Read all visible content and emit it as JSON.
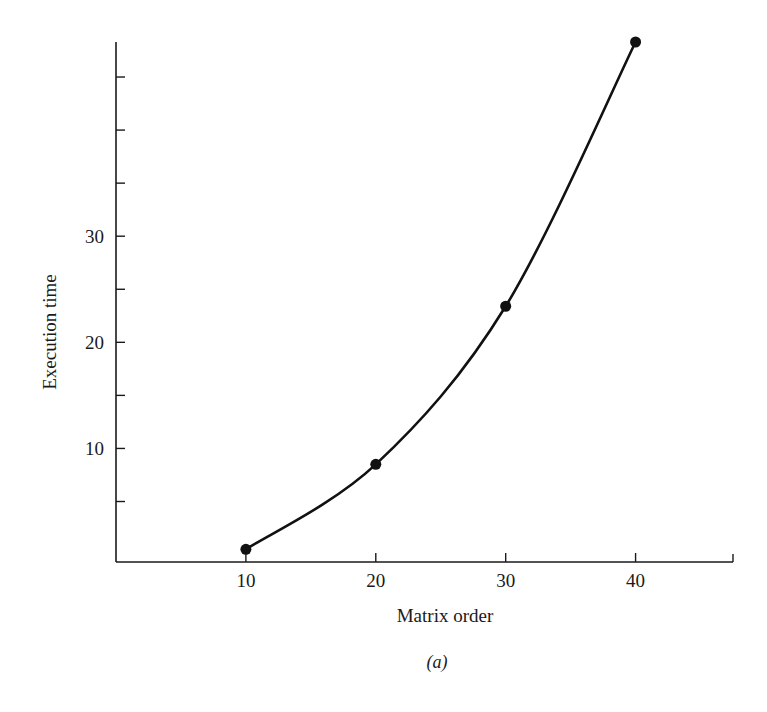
{
  "chart_data": {
    "type": "line",
    "title": "",
    "caption": "(a)",
    "xlabel": "Matrix order",
    "ylabel": "Execution time",
    "x": [
      10,
      20,
      30,
      40
    ],
    "series": [
      {
        "name": "Execution time",
        "values": [
          0.5,
          8.5,
          23.4,
          48.3
        ],
        "markers": true,
        "smooth_curve": true
      }
    ],
    "x_ticks": [
      10,
      20,
      30,
      40
    ],
    "x_tick_labels": [
      "10",
      "20",
      "30",
      "40"
    ],
    "y_ticks": [
      5,
      10,
      15,
      20,
      25,
      30,
      35,
      40,
      45
    ],
    "y_tick_labels": {
      "10": "10",
      "20": "20",
      "30": "30"
    },
    "xlim": [
      0,
      47.5
    ],
    "ylim": [
      -0.7,
      48.3
    ],
    "grid": false,
    "legend": "none",
    "colors": {
      "line": "#111111",
      "axis": "#1a1a1a",
      "background": "#ffffff"
    }
  }
}
